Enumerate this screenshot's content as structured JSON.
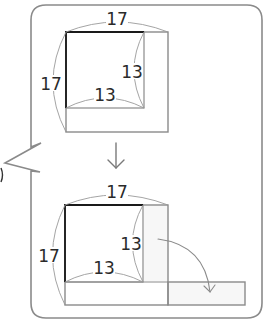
{
  "diagram": {
    "type": "area-rearrangement",
    "top_figure": {
      "outer_side_top": "17",
      "outer_side_left": "17",
      "inner_side_right": "13",
      "inner_side_bottom": "13"
    },
    "transition_arrow": "down-arrow",
    "bottom_figure": {
      "outer_side_top": "17",
      "outer_side_left": "17",
      "inner_side_right": "13",
      "inner_side_bottom": "13",
      "move_arrow": "curved-arrow"
    },
    "colors": {
      "frame": "#8a8a8a",
      "bold_edge": "#1a1a1a",
      "text": "#2a2a2a",
      "background": "#ffffff"
    }
  }
}
